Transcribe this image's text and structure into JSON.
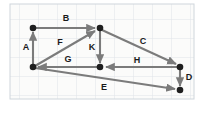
{
  "figure": {
    "background_color": "#ffffff",
    "paper_color": "#fbfbfa",
    "grid_color": "#d8dde2",
    "grid_color_minor": "#e7ebef",
    "edge_color": "#7b7b7b",
    "node_color": "#1f1f1f",
    "label_color": "#1a1a1a"
  },
  "grid": {
    "visible": true,
    "spacing_px": 19,
    "area": {
      "x": 10,
      "y": 4,
      "width": 184,
      "height": 95
    }
  },
  "nodes": [
    {
      "id": "n_top_left",
      "name": "node-top-left",
      "x": 33,
      "y": 28
    },
    {
      "id": "n_top_center",
      "name": "node-top-center",
      "x": 100,
      "y": 28
    },
    {
      "id": "n_bottom_left",
      "name": "node-bottom-left",
      "x": 33,
      "y": 67
    },
    {
      "id": "n_middle",
      "name": "node-middle",
      "x": 100,
      "y": 67
    },
    {
      "id": "n_right",
      "name": "node-right",
      "x": 180,
      "y": 67
    },
    {
      "id": "n_bottom_right",
      "name": "node-bottom-right",
      "x": 180,
      "y": 90
    }
  ],
  "edges": [
    {
      "id": "edge_A",
      "label": "A",
      "from": "n_bottom_left",
      "to": "n_top_left",
      "label_x": 26,
      "label_y": 48
    },
    {
      "id": "edge_B",
      "label": "B",
      "from": "n_top_left",
      "to": "n_top_center",
      "label_x": 66,
      "label_y": 19
    },
    {
      "id": "edge_F",
      "label": "F",
      "from": "n_bottom_left",
      "to": "n_top_center",
      "label_x": 60,
      "label_y": 43
    },
    {
      "id": "edge_K",
      "label": "K",
      "from": "n_top_center",
      "to": "n_middle",
      "label_x": 92,
      "label_y": 48
    },
    {
      "id": "edge_C",
      "label": "C",
      "from": "n_top_center",
      "to": "n_right",
      "label_x": 143,
      "label_y": 42
    },
    {
      "id": "edge_G",
      "label": "G",
      "from": "n_middle",
      "to": "n_bottom_left",
      "label_x": 68,
      "label_y": 60
    },
    {
      "id": "edge_H",
      "label": "H",
      "from": "n_right",
      "to": "n_middle",
      "label_x": 137,
      "label_y": 61
    },
    {
      "id": "edge_D",
      "label": "D",
      "from": "n_right",
      "to": "n_bottom_right",
      "label_x": 189,
      "label_y": 78
    },
    {
      "id": "edge_E",
      "label": "E",
      "from": "n_bottom_left",
      "to": "n_bottom_right",
      "label_x": 104,
      "label_y": 88
    }
  ],
  "labels": {
    "A": "A",
    "B": "B",
    "C": "C",
    "D": "D",
    "E": "E",
    "F": "F",
    "G": "G",
    "H": "H",
    "K": "K"
  }
}
